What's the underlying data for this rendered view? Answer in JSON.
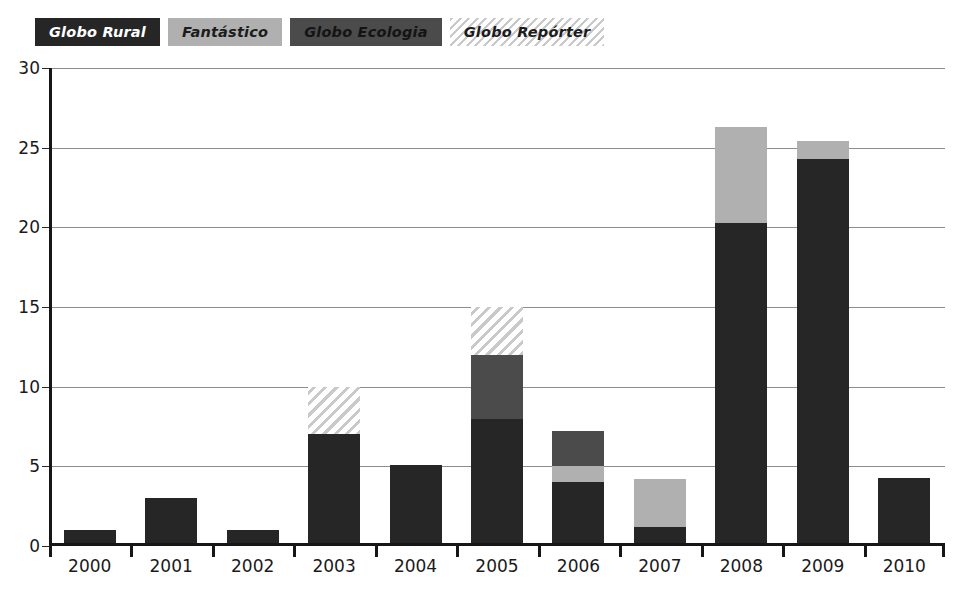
{
  "legend": {
    "position": "top-left",
    "items": [
      {
        "label": "Globo Rural",
        "key": "rural",
        "color": "#262626",
        "style": "solid"
      },
      {
        "label": "Fantástico",
        "key": "fantastico",
        "color": "#b0b0b0",
        "style": "solid"
      },
      {
        "label": "Globo Ecologia",
        "key": "ecologia",
        "color": "#4b4b4b",
        "style": "solid"
      },
      {
        "label": "Globo Repórter",
        "key": "reporter",
        "color": "#c9c9c9",
        "style": "diagonal-hatch"
      }
    ]
  },
  "axes": {
    "y_ticks": [
      0,
      5,
      10,
      15,
      20,
      25,
      30
    ],
    "y_tick_labels": [
      "0",
      "5",
      "10",
      "15",
      "20",
      "25",
      "30"
    ],
    "ylim": [
      0,
      30
    ],
    "grid": true
  },
  "chart_data": {
    "type": "bar",
    "stacked": true,
    "title": "",
    "subtitle": "",
    "xlabel": "",
    "ylabel": "",
    "ylim": [
      0,
      30
    ],
    "grid": true,
    "legend_position": "top-left",
    "categories": [
      "2000",
      "2001",
      "2002",
      "2003",
      "2004",
      "2005",
      "2006",
      "2007",
      "2008",
      "2009",
      "2010"
    ],
    "series": [
      {
        "name": "Globo Rural",
        "color": "#262626",
        "values": [
          1,
          3,
          1,
          7,
          5.1,
          8,
          4,
          1.2,
          20.3,
          24.3,
          4.3
        ]
      },
      {
        "name": "Fantástico",
        "color": "#b0b0b0",
        "values": [
          0,
          0,
          0,
          0,
          0,
          0,
          1,
          3,
          6,
          1.1,
          0
        ]
      },
      {
        "name": "Globo Ecologia",
        "color": "#4b4b4b",
        "values": [
          0,
          0,
          0,
          0,
          0,
          4,
          2.2,
          0,
          0,
          0,
          0
        ]
      },
      {
        "name": "Globo Repórter",
        "color": "#c9c9c9",
        "values": [
          0,
          0,
          0,
          3,
          0,
          3,
          0,
          0,
          0,
          0,
          0
        ]
      }
    ],
    "totals": [
      1,
      3,
      1,
      10,
      5.1,
      15,
      7.2,
      4.2,
      26.3,
      25.4,
      4.3
    ]
  }
}
